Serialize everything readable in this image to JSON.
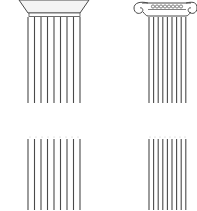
{
  "diagram": {
    "colors": {
      "background": "#ffffff",
      "stroke": "#4a4a4a",
      "capital_fill": "#f4f4f4",
      "dots": "#bbbbbb"
    },
    "columns": [
      {
        "id": "doric-full",
        "style": "doric",
        "shaft_x": [
          28,
          34.5,
          41,
          47.5,
          54,
          60.5,
          67,
          73.5,
          80
        ],
        "shaft_y": [
          17,
          103
        ]
      },
      {
        "id": "ionic-full",
        "style": "ionic",
        "shaft_x": [
          149,
          153.6,
          158.2,
          162.8,
          167.4,
          172,
          176.6,
          181.2,
          185.8
        ],
        "shaft_y": [
          17,
          103
        ]
      },
      {
        "id": "doric-fragment",
        "style": "doric",
        "shaft_x": [
          28,
          34.5,
          41,
          47.5,
          54,
          60.5,
          67,
          73.5,
          80
        ],
        "shaft_y": [
          139,
          210
        ]
      },
      {
        "id": "ionic-fragment",
        "style": "ionic",
        "shaft_x": [
          149,
          153.6,
          158.2,
          162.8,
          167.4,
          172,
          176.6,
          181.2,
          185.8
        ],
        "shaft_y": [
          139,
          210
        ]
      }
    ]
  }
}
